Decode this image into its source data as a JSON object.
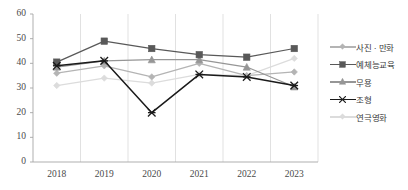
{
  "chart_data": {
    "type": "line",
    "title": "",
    "xlabel": "",
    "ylabel": "",
    "x": [
      "2018",
      "2019",
      "2020",
      "2021",
      "2022",
      "2023"
    ],
    "categories": [
      "2018",
      "2019",
      "2020",
      "2021",
      "2022",
      "2023"
    ],
    "ylim": [
      0,
      60
    ],
    "yticks": [
      "0",
      "10",
      "20",
      "30",
      "40",
      "50",
      "60"
    ],
    "grid": "vertical",
    "legend_position": "right",
    "series": [
      {
        "name": "사진 · 만화",
        "color": "#b4b4b4",
        "marker": "diamond",
        "values": [
          36,
          39,
          34.5,
          40,
          35,
          36.5
        ]
      },
      {
        "name": "예체능교육",
        "color": "#595959",
        "marker": "square",
        "values": [
          40.5,
          49,
          46,
          43.5,
          42.5,
          46
        ]
      },
      {
        "name": "무용",
        "color": "#969696",
        "marker": "triangle",
        "values": [
          38.5,
          41,
          41.5,
          41.5,
          38.5,
          30.5
        ]
      },
      {
        "name": "조형",
        "color": "#1a1a1a",
        "marker": "star",
        "values": [
          39,
          41,
          20,
          35.5,
          34.5,
          31
        ]
      },
      {
        "name": "연극영화",
        "color": "#dcdcdc",
        "marker": "diamond",
        "values": [
          31,
          34,
          32,
          35.5,
          35,
          42
        ]
      }
    ]
  },
  "axis": {
    "y_ticks": [
      "60",
      "50",
      "40",
      "30",
      "20",
      "10",
      "0"
    ],
    "x_ticks": [
      "2018",
      "2019",
      "2020",
      "2021",
      "2022",
      "2023"
    ]
  },
  "legend": {
    "items": [
      {
        "label": "사진 · 만화"
      },
      {
        "label": "예체능교육"
      },
      {
        "label": "무용"
      },
      {
        "label": "조형"
      },
      {
        "label": "연극영화"
      }
    ]
  },
  "top_sliver": {
    "text": ""
  }
}
